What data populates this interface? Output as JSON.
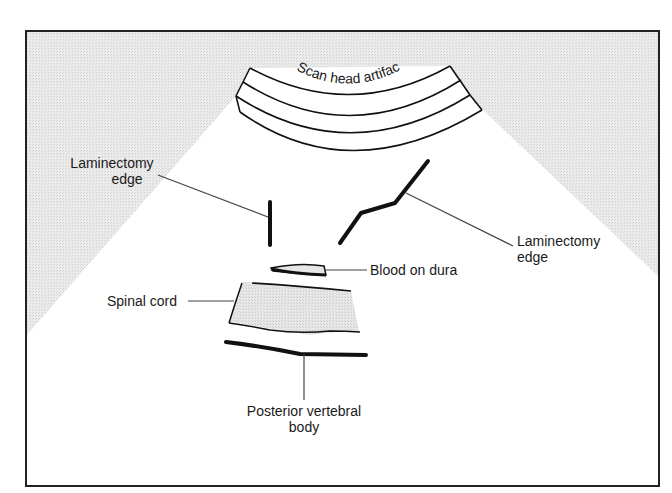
{
  "figure": {
    "colors": {
      "frame": "#222222",
      "shadow_region": "#e6e6e6",
      "ink": "#111111",
      "leader": "#444444",
      "tissue_fill": "#e4e4e4"
    }
  },
  "labels": {
    "scan_head": "Scan head artifact",
    "lam_left_1": "Laminectomy",
    "lam_left_2": "edge",
    "lam_right_1": "Laminectomy",
    "lam_right_2": "edge",
    "blood": "Blood on dura",
    "cord": "Spinal cord",
    "vertebral_1": "Posterior vertebral",
    "vertebral_2": "body"
  }
}
